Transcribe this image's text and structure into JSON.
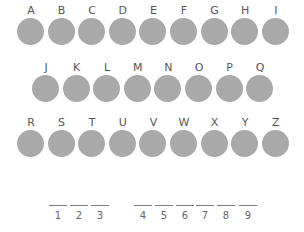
{
  "colors": {
    "disc": "#a9a9a9",
    "label": "#555555",
    "line": "#7a7a7a"
  },
  "keyboard": {
    "rows": [
      [
        "A",
        "B",
        "C",
        "D",
        "E",
        "F",
        "G",
        "H",
        "I"
      ],
      [
        "J",
        "K",
        "L",
        "M",
        "N",
        "O",
        "P",
        "Q"
      ],
      [
        "R",
        "S",
        "T",
        "U",
        "V",
        "W",
        "X",
        "Y",
        "Z"
      ]
    ]
  },
  "answer": {
    "groups": [
      {
        "slots": [
          {
            "number": "1",
            "letter": ""
          },
          {
            "number": "2",
            "letter": ""
          },
          {
            "number": "3",
            "letter": ""
          }
        ]
      },
      {
        "slots": [
          {
            "number": "4",
            "letter": ""
          },
          {
            "number": "5",
            "letter": ""
          },
          {
            "number": "6",
            "letter": ""
          },
          {
            "number": "7",
            "letter": ""
          },
          {
            "number": "8",
            "letter": ""
          },
          {
            "number": "9",
            "letter": ""
          }
        ]
      }
    ]
  }
}
